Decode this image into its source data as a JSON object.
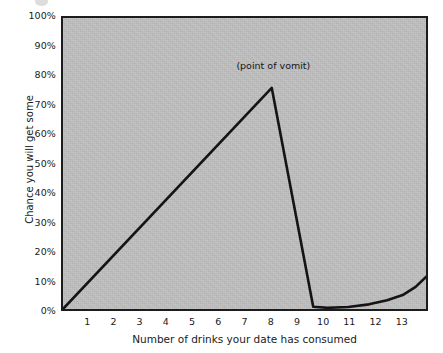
{
  "chart_data": {
    "type": "line",
    "title": "",
    "subtitle": "",
    "xlabel": "Number of drinks your date has consumed",
    "ylabel": "Chance you will get some",
    "xlim": [
      0,
      14
    ],
    "ylim": [
      0,
      100
    ],
    "grid": false,
    "legend": null,
    "xticks": [
      "1",
      "2",
      "3",
      "4",
      "5",
      "6",
      "7",
      "8",
      "9",
      "10",
      "11",
      "12",
      "13"
    ],
    "xtick_values": [
      1,
      2,
      3,
      4,
      5,
      6,
      7,
      8,
      9,
      10,
      11,
      12,
      13
    ],
    "yticks": [
      "0%",
      "10%",
      "20%",
      "30%",
      "40%",
      "50%",
      "60%",
      "70%",
      "80%",
      "90%",
      "100%"
    ],
    "ytick_values": [
      0,
      10,
      20,
      30,
      40,
      50,
      60,
      70,
      80,
      90,
      100
    ],
    "annotations": [
      {
        "text": "(point of vomit)",
        "x": 8.1,
        "y": 83
      }
    ],
    "series": [
      {
        "name": "Chance you will get some",
        "color": "#141414",
        "points": [
          [
            0.0,
            0.0
          ],
          [
            8.05,
            76.0
          ],
          [
            9.65,
            0.8
          ],
          [
            10.2,
            0.4
          ],
          [
            11.0,
            0.7
          ],
          [
            11.8,
            1.6
          ],
          [
            12.5,
            3.0
          ],
          [
            13.1,
            4.8
          ],
          [
            13.6,
            7.6
          ],
          [
            14.0,
            11.0
          ]
        ]
      }
    ],
    "colors": {
      "plot_background": "#bebebe",
      "page_background": "#ffffff",
      "line": "#141414",
      "axis": "#1c1c1c",
      "text": "#1a1a1a"
    }
  }
}
